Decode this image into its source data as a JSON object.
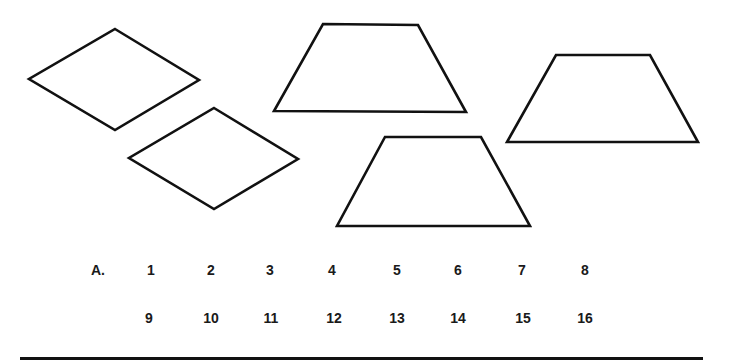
{
  "figure": {
    "shapes": [
      {
        "id": "rhombus-1",
        "type": "rhombus",
        "points": "115,29 199,80 115,130 29,79"
      },
      {
        "id": "rhombus-2",
        "type": "rhombus",
        "points": "214,108 298,159 214,209 129,158"
      },
      {
        "id": "trapezoid-1",
        "type": "trapezoid",
        "points": "323,24 418,25 466,112 274,111"
      },
      {
        "id": "trapezoid-2",
        "type": "trapezoid",
        "points": "385,137 481,137 530,226 337,226"
      },
      {
        "id": "trapezoid-3",
        "type": "trapezoid",
        "points": "556,55 650,55 698,142 507,142"
      }
    ],
    "stroke_color": "#111111"
  },
  "answer_row": {
    "prefix": "A.",
    "row1": [
      "1",
      "2",
      "3",
      "4",
      "5",
      "6",
      "7",
      "8"
    ],
    "row2": [
      "9",
      "10",
      "11",
      "12",
      "13",
      "14",
      "15",
      "16"
    ]
  }
}
